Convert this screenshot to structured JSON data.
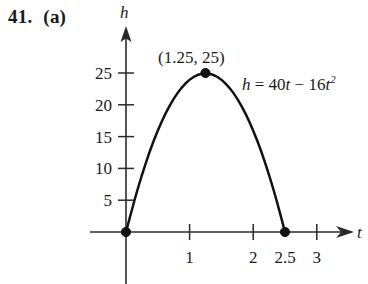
{
  "exercise": {
    "number": "41.",
    "part": "(a)"
  },
  "chart_data": {
    "type": "line",
    "title": "",
    "subtitle": "",
    "equation_text": "h = 40t − 16t²",
    "equation_parts": {
      "lhs": "h",
      "equals": "=",
      "term1_coefficient": "40",
      "term1_variable": "t",
      "operator": "−",
      "term2_coefficient": "16",
      "term2_variable": "t",
      "term2_exponent": "2"
    },
    "function": {
      "form": "quadratic",
      "a": -16,
      "b": 40,
      "c": 0
    },
    "xlabel": "t",
    "ylabel": "h",
    "xlim": [
      -0.55,
      3.6
    ],
    "ylim": [
      -10,
      29
    ],
    "grid": false,
    "legend": false,
    "x_ticks": [
      {
        "value": 1,
        "label": "1",
        "has_tick_mark": true
      },
      {
        "value": 2,
        "label": "2",
        "has_tick_mark": true
      },
      {
        "value": 2.5,
        "label": "2.5",
        "has_tick_mark": false
      },
      {
        "value": 3,
        "label": "3",
        "has_tick_mark": true
      }
    ],
    "y_ticks": [
      {
        "value": 25,
        "label": "25"
      },
      {
        "value": 20,
        "label": "20"
      },
      {
        "value": 15,
        "label": "15"
      },
      {
        "value": 10,
        "label": "10"
      },
      {
        "value": 5,
        "label": "5"
      }
    ],
    "x": [
      0,
      0.125,
      0.25,
      0.375,
      0.5,
      0.625,
      0.75,
      0.875,
      1,
      1.125,
      1.25,
      1.375,
      1.5,
      1.625,
      1.75,
      1.875,
      2,
      2.125,
      2.25,
      2.375,
      2.5
    ],
    "y": [
      0,
      4.75,
      9,
      12.75,
      16,
      18.75,
      21,
      22.75,
      24,
      24.75,
      25,
      24.75,
      24,
      22.75,
      21,
      18.75,
      16,
      12.75,
      9,
      4.75,
      0
    ],
    "marked_points": [
      {
        "name": "origin",
        "x": 0,
        "y": 0,
        "label": ""
      },
      {
        "name": "vertex",
        "x": 1.25,
        "y": 25,
        "label": "(1.25, 25)"
      },
      {
        "name": "root",
        "x": 2.5,
        "y": 0,
        "label": ""
      }
    ],
    "annotations": [
      {
        "name": "vertex-coordinate-label",
        "text": "(1.25, 25)"
      }
    ]
  }
}
